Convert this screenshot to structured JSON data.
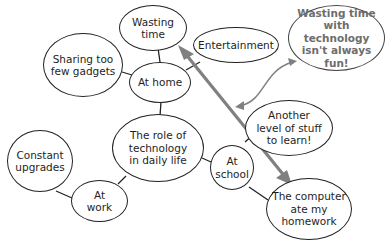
{
  "diagram": {
    "type": "concept-web",
    "center": {
      "id": "center",
      "label": "The role of\ntechnology\nin daily life"
    },
    "nodes": [
      {
        "id": "home",
        "label": "At home"
      },
      {
        "id": "wasting",
        "label": "Wasting\ntime"
      },
      {
        "id": "sharing",
        "label": "Sharing too\nfew gadgets"
      },
      {
        "id": "entertainment",
        "label": "Entertainment"
      },
      {
        "id": "work",
        "label": "At\nwork"
      },
      {
        "id": "upgrades",
        "label": "Constant\nupgrades"
      },
      {
        "id": "school",
        "label": "At\nschool"
      },
      {
        "id": "learn",
        "label": "Another\nlevel of stuff\nto learn!"
      },
      {
        "id": "homework",
        "label": "The computer\nate my\nhomework"
      },
      {
        "id": "conclusion",
        "label": "Wasting time\nwith technology\nisn't always\nfun!"
      }
    ],
    "edges": [
      {
        "from": "center",
        "to": "home"
      },
      {
        "from": "home",
        "to": "wasting"
      },
      {
        "from": "home",
        "to": "sharing"
      },
      {
        "from": "home",
        "to": "entertainment"
      },
      {
        "from": "center",
        "to": "work"
      },
      {
        "from": "work",
        "to": "upgrades"
      },
      {
        "from": "center",
        "to": "school"
      },
      {
        "from": "school",
        "to": "learn"
      },
      {
        "from": "school",
        "to": "homework"
      }
    ],
    "arrows": [
      {
        "from": "wasting",
        "to": "homework",
        "style": "thick double-headed",
        "color": "#808080"
      },
      {
        "from": "conclusion",
        "to": "big-arrow",
        "style": "curved double-headed",
        "color": "#808080"
      }
    ],
    "colors": {
      "outline": "#222222",
      "arrow": "#808080",
      "conclusion_text": "#6d6d6d"
    }
  }
}
